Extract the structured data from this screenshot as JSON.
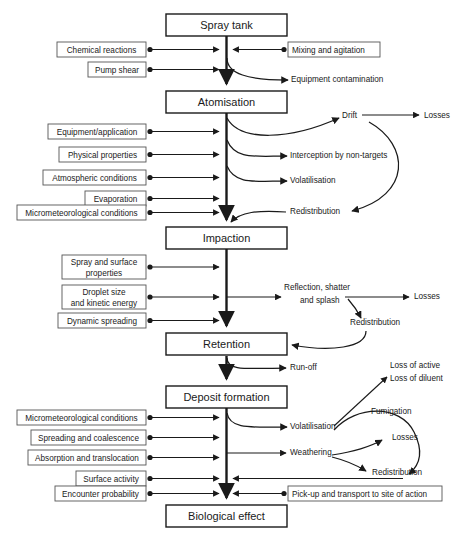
{
  "diagram": {
    "colors": {
      "line": "#1a1a1a",
      "box_border": "#555555",
      "background": "#ffffff"
    },
    "stages": [
      {
        "id": "spray-tank",
        "label": "Spray tank",
        "x": 166,
        "y": 14,
        "w": 121,
        "h": 22
      },
      {
        "id": "atomisation",
        "label": "Atomisation",
        "x": 166,
        "y": 91,
        "w": 121,
        "h": 22
      },
      {
        "id": "impaction",
        "label": "Impaction",
        "x": 166,
        "y": 227,
        "w": 121,
        "h": 22
      },
      {
        "id": "retention",
        "label": "Retention",
        "x": 166,
        "y": 333,
        "w": 121,
        "h": 22
      },
      {
        "id": "deposit-formation",
        "label": "Deposit formation",
        "x": 166,
        "y": 386,
        "w": 121,
        "h": 22
      },
      {
        "id": "biological-effect",
        "label": "Biological effect",
        "x": 166,
        "y": 505,
        "w": 121,
        "h": 22
      }
    ],
    "factors": [
      {
        "id": "chemical-reactions",
        "lines": [
          "Chemical reactions"
        ],
        "x": 57,
        "y": 42,
        "w": 89,
        "h": 15
      },
      {
        "id": "pump-shear",
        "lines": [
          "Pump shear"
        ],
        "x": 88,
        "y": 62,
        "w": 58,
        "h": 15
      },
      {
        "id": "equipment-application",
        "lines": [
          "Equipment/application"
        ],
        "x": 48,
        "y": 124,
        "w": 98,
        "h": 15
      },
      {
        "id": "physical-properties",
        "lines": [
          "Physical properties"
        ],
        "x": 59,
        "y": 147,
        "w": 87,
        "h": 15
      },
      {
        "id": "atmospheric-conditions",
        "lines": [
          "Atmospheric conditions"
        ],
        "x": 43,
        "y": 170,
        "w": 103,
        "h": 15
      },
      {
        "id": "evaporation",
        "lines": [
          "Evaporation"
        ],
        "x": 85,
        "y": 191,
        "w": 61,
        "h": 15
      },
      {
        "id": "micrometeorological-top",
        "lines": [
          "Micrometeorological conditions"
        ],
        "x": 17,
        "y": 205,
        "w": 129,
        "h": 15
      },
      {
        "id": "spray-and-surface-properties",
        "lines": [
          "Spray and surface",
          "properties"
        ],
        "x": 62,
        "y": 255,
        "w": 84,
        "h": 24
      },
      {
        "id": "droplet-size-kinetic-energy",
        "lines": [
          "Droplet size",
          "and kinetic energy"
        ],
        "x": 62,
        "y": 285,
        "w": 84,
        "h": 24
      },
      {
        "id": "dynamic-spreading",
        "lines": [
          "Dynamic spreading"
        ],
        "x": 58,
        "y": 313,
        "w": 88,
        "h": 15
      },
      {
        "id": "micrometeorological-bottom",
        "lines": [
          "Micrometeorological conditions"
        ],
        "x": 17,
        "y": 410,
        "w": 129,
        "h": 15
      },
      {
        "id": "spreading-and-coalescence",
        "lines": [
          "Spreading and coalescence"
        ],
        "x": 31,
        "y": 430,
        "w": 115,
        "h": 15
      },
      {
        "id": "absorption-and-translocation",
        "lines": [
          "Absorption and translocation"
        ],
        "x": 28,
        "y": 450,
        "w": 118,
        "h": 15
      },
      {
        "id": "surface-activity",
        "lines": [
          "Surface activity"
        ],
        "x": 76,
        "y": 471,
        "w": 70,
        "h": 15
      },
      {
        "id": "encounter-probability",
        "lines": [
          "Encounter probability"
        ],
        "x": 55,
        "y": 486,
        "w": 91,
        "h": 15
      }
    ],
    "right_boxes": [
      {
        "id": "mixing-and-agitation",
        "label": "Mixing and agitation",
        "x": 288,
        "y": 42,
        "w": 92,
        "h": 15
      },
      {
        "id": "pick-up-and-transport",
        "label": "Pick-up and transport to site of action",
        "x": 288,
        "y": 486,
        "w": 154,
        "h": 15
      }
    ],
    "outputs": [
      {
        "id": "equipment-contamination",
        "label": "Equipment contamination",
        "x": 291,
        "y": 82
      },
      {
        "id": "drift",
        "label": "Drift",
        "x": 342,
        "y": 118
      },
      {
        "id": "losses-drift",
        "label": "Losses",
        "x": 424,
        "y": 118
      },
      {
        "id": "interception",
        "label": "Interception by non-targets",
        "x": 290,
        "y": 158
      },
      {
        "id": "volatilisation-atom",
        "label": "Volatilisation",
        "x": 290,
        "y": 183
      },
      {
        "id": "redistribution-atom",
        "label": "Redistribution",
        "x": 290,
        "y": 214
      },
      {
        "id": "reflection-shatter-1",
        "label": "Reflection, shatter",
        "x": 284,
        "y": 290
      },
      {
        "id": "reflection-shatter-2",
        "label": "and splash",
        "x": 300,
        "y": 303
      },
      {
        "id": "losses-impaction",
        "label": "Losses",
        "x": 414,
        "y": 299
      },
      {
        "id": "redistribution-impaction",
        "label": "Redistribution",
        "x": 350,
        "y": 325
      },
      {
        "id": "run-off",
        "label": "Run-off",
        "x": 290,
        "y": 370
      },
      {
        "id": "loss-of-active",
        "label": "Loss of active",
        "x": 390,
        "y": 368
      },
      {
        "id": "loss-of-diluent",
        "label": "Loss of diluent",
        "x": 390,
        "y": 381
      },
      {
        "id": "fumigation",
        "label": "Fumigation",
        "x": 371,
        "y": 414
      },
      {
        "id": "volatilisation-deposit",
        "label": "Volatilisation",
        "x": 290,
        "y": 429
      },
      {
        "id": "losses-weathering",
        "label": "Losses",
        "x": 392,
        "y": 440
      },
      {
        "id": "weathering",
        "label": "Weathering",
        "x": 290,
        "y": 455
      },
      {
        "id": "redistribution-deposit",
        "label": "Redistribution",
        "x": 372,
        "y": 475
      }
    ]
  }
}
